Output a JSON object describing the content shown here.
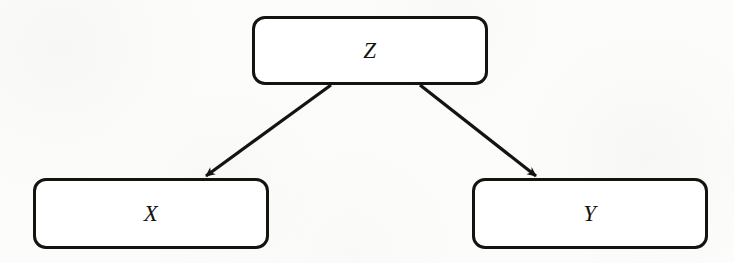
{
  "figure": {
    "type": "causal-diagram",
    "background_color": "#fcfcfa",
    "stroke_color": "#15130f",
    "node_fill_color": "#ffffff"
  },
  "nodes": [
    {
      "id": "z",
      "label": "Z",
      "x": 252,
      "y": 16,
      "width": 236,
      "height": 69
    },
    {
      "id": "x",
      "label": "X",
      "x": 33,
      "y": 178,
      "width": 236,
      "height": 71
    },
    {
      "id": "y",
      "label": "Y",
      "x": 472,
      "y": 178,
      "width": 236,
      "height": 71
    }
  ],
  "edges": [
    {
      "id": "z-to-x",
      "from": "Z",
      "to": "X",
      "direction": "directed",
      "start": [
        331,
        85
      ],
      "end": [
        206,
        176
      ]
    },
    {
      "id": "z-to-y",
      "from": "Z",
      "to": "Y",
      "direction": "directed",
      "start": [
        420,
        85
      ],
      "end": [
        536,
        176
      ]
    }
  ]
}
